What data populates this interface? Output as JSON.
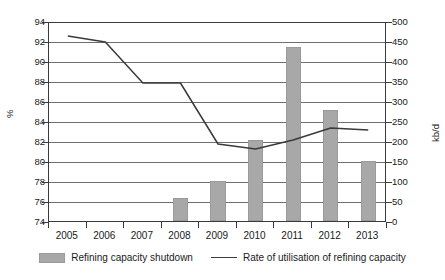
{
  "chart_data": {
    "type": "bar",
    "title": "",
    "subtitle": "",
    "categories": [
      "2005",
      "2006",
      "2007",
      "2008",
      "2009",
      "2010",
      "2011",
      "2012",
      "2013"
    ],
    "xlabel": "",
    "ylabel": "%",
    "ylabel_secondary": "kb/d",
    "ylim": [
      74,
      94
    ],
    "ylim_secondary": [
      0,
      500
    ],
    "yticks": [
      94,
      92,
      90,
      88,
      86,
      84,
      82,
      80,
      78,
      76,
      74
    ],
    "yticks_secondary": [
      500,
      450,
      400,
      350,
      300,
      250,
      200,
      150,
      100,
      50,
      0
    ],
    "grid": true,
    "legend_position": "bottom",
    "series": [
      {
        "name": "Refining capacity shutdown",
        "type": "bar",
        "axis": "secondary",
        "unit": "kb/d",
        "color": "#a8a8a8",
        "values": [
          0,
          0,
          0,
          58,
          100,
          203,
          436,
          278,
          150
        ]
      },
      {
        "name": "Rate of utilisation of refining capacity",
        "type": "line",
        "axis": "primary",
        "unit": "%",
        "color": "#3a3a3a",
        "values": [
          92.6,
          92.0,
          87.9,
          87.9,
          81.8,
          81.3,
          82.2,
          83.4,
          83.2
        ]
      }
    ]
  },
  "legend": {
    "items": [
      {
        "label": "Refining capacity shutdown",
        "marker": "bar-swatch-icon"
      },
      {
        "label": "Rate of utilisation of refining capacity",
        "marker": "line-swatch-icon"
      }
    ]
  }
}
